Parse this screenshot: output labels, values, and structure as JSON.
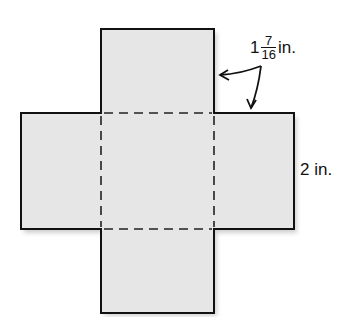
{
  "diagram": {
    "type": "net of rectangular prism (cross shape)",
    "colors": {
      "fill": "#e6e6e6",
      "stroke": "#111111",
      "shadow": "#d0d0d0"
    },
    "labels": {
      "top_dimension": {
        "whole": "1",
        "numerator": "7",
        "denominator": "16",
        "unit": "in."
      },
      "side_dimension": {
        "value": "2",
        "unit": "in."
      }
    }
  }
}
